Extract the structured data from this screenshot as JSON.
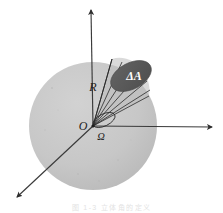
{
  "figure": {
    "caption_partial": "图 1-3   立体角的定义",
    "colors": {
      "background": "#ffffff",
      "sphere_fill": "#c6c6c6",
      "patch_fill": "#5a5a5a",
      "axis_stroke": "#3a3a3a",
      "ray_stroke": "#2b2b2b",
      "label_color": "#1c1c1c",
      "patch_label_color": "#ffffff"
    },
    "sphere": {
      "center_x": 93,
      "center_y": 126,
      "radius": 64,
      "name": "sphere-body"
    },
    "patch": {
      "label": "ΔA",
      "center_x": 131,
      "center_y": 76,
      "rx": 22,
      "ry": 13,
      "rotation_deg": -28
    },
    "solid_angle": {
      "label": "Ω",
      "center_x": 104,
      "center_y": 120,
      "rx": 12,
      "ry": 6,
      "rotation_deg": -26
    },
    "labels": {
      "radius": "R",
      "origin": "O",
      "solid_angle": "Ω",
      "area_element": "ΔA"
    },
    "axes": [
      {
        "name": "axis-vertical",
        "x1": 93,
        "y1": 126,
        "x2": 91,
        "y2": 9,
        "arrow": true
      },
      {
        "name": "axis-horizontal",
        "x1": 93,
        "y1": 126,
        "x2": 214,
        "y2": 127,
        "arrow": true
      },
      {
        "name": "axis-diagonal",
        "x1": 93,
        "y1": 126,
        "x2": 15,
        "y2": 199,
        "arrow": true
      }
    ],
    "cone_rays": [
      {
        "name": "cone-ray-1",
        "x2": 112,
        "y2": 59
      },
      {
        "name": "cone-ray-2",
        "x2": 122,
        "y2": 62
      },
      {
        "name": "cone-ray-3",
        "x2": 132,
        "y2": 66
      },
      {
        "name": "cone-ray-4",
        "x2": 140,
        "y2": 73
      },
      {
        "name": "cone-ray-5",
        "x2": 147,
        "y2": 81
      },
      {
        "name": "cone-ray-6",
        "x2": 150,
        "y2": 90
      },
      {
        "name": "cone-ray-7",
        "x2": 149,
        "y2": 96
      }
    ]
  }
}
